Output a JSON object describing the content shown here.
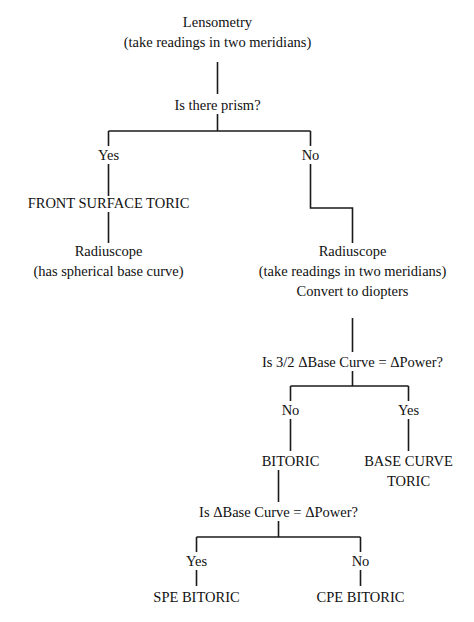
{
  "diagram": {
    "background_color": "#ffffff",
    "line_color": "#1a1a1a",
    "text_color": "#111111",
    "nodes": {
      "lensometry": {
        "line1": "Lensometry",
        "line2": "(take readings in two meridians)"
      },
      "is_there_prism": {
        "line1": "Is there prism?"
      },
      "front_surface_toric": {
        "line1": "FRONT SURFACE TORIC"
      },
      "radiuscope_left": {
        "line1": "Radiuscope",
        "line2": "(has spherical base curve)"
      },
      "radiuscope_right": {
        "line1": "Radiuscope",
        "line2": "(take readings in two meridians)",
        "line3": "Convert to diopters"
      },
      "is_three_halves_base_curve": {
        "line1": "Is 3/2 ΔBase Curve = ΔPower?"
      },
      "bitoric": {
        "line1": "BITORIC"
      },
      "base_curve_toric": {
        "line1": "BASE CURVE",
        "line2": "TORIC"
      },
      "is_base_curve_equals_power": {
        "line1": "Is ΔBase Curve = ΔPower?"
      },
      "spe_bitoric": {
        "line1": "SPE BITORIC"
      },
      "cpe_bitoric": {
        "line1": "CPE BITORIC"
      }
    },
    "branch_labels": {
      "prism_yes": "Yes",
      "prism_no": "No",
      "three_halves_no": "No",
      "three_halves_yes": "Yes",
      "equals_yes": "Yes",
      "equals_no": "No"
    }
  }
}
